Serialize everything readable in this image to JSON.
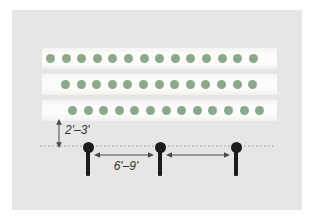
{
  "diagram": {
    "name": "staggered-row-planting-spacing-diagram",
    "rows": [
      {
        "dot_count": 14
      },
      {
        "dot_count": 13
      },
      {
        "dot_count": 13
      }
    ],
    "posts": {
      "count": 3,
      "centers_x": [
        76,
        148,
        224
      ],
      "center_y": 137
    },
    "measurements": {
      "row_to_line": "2'–3'",
      "post_spacing": "6'–9'"
    },
    "colors": {
      "panel": "#e6e6e4",
      "strip": "#fcfcfb",
      "dot": "#8ba88b",
      "post": "#1c1c1c",
      "line": "#9a9a9a",
      "arrow": "#4a4a4a",
      "label": "#333333"
    }
  }
}
